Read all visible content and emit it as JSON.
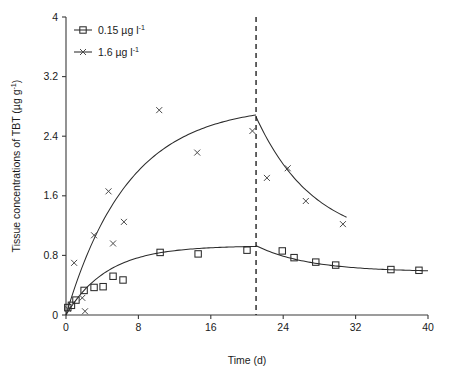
{
  "chart_data": {
    "type": "scatter",
    "title": "",
    "xlabel": "Time (d)",
    "ylabel": "Tissue concentrations of TBT (µg g⁻¹)",
    "xlim": [
      0,
      40
    ],
    "ylim": [
      0,
      4
    ],
    "xticks": [
      "0",
      "8",
      "16",
      "24",
      "32",
      "40"
    ],
    "xtick_values": [
      0,
      8,
      16,
      24,
      32,
      40
    ],
    "yticks": [
      "0",
      "0.8",
      "1.6",
      "2.4",
      "3.2",
      "4"
    ],
    "ytick_values": [
      0,
      0.8,
      1.6,
      2.4,
      3.2,
      4
    ],
    "grid": false,
    "legend_position": "top-left",
    "annotations": [
      {
        "name": "exposure-depuration-divider",
        "type": "vline",
        "x": 21,
        "style": "dashed"
      }
    ],
    "series": [
      {
        "name": "0.15 µg l⁻¹",
        "marker": "square",
        "points": [
          {
            "x": 0.2,
            "y": 0.1
          },
          {
            "x": 0.6,
            "y": 0.13
          },
          {
            "x": 1.1,
            "y": 0.2
          },
          {
            "x": 2.0,
            "y": 0.33
          },
          {
            "x": 3.1,
            "y": 0.37
          },
          {
            "x": 4.1,
            "y": 0.38
          },
          {
            "x": 5.2,
            "y": 0.52
          },
          {
            "x": 6.3,
            "y": 0.47
          },
          {
            "x": 10.4,
            "y": 0.84
          },
          {
            "x": 14.6,
            "y": 0.82
          },
          {
            "x": 20.0,
            "y": 0.87
          },
          {
            "x": 23.9,
            "y": 0.86
          },
          {
            "x": 25.2,
            "y": 0.77
          },
          {
            "x": 27.6,
            "y": 0.71
          },
          {
            "x": 29.8,
            "y": 0.67
          },
          {
            "x": 35.9,
            "y": 0.61
          },
          {
            "x": 39.0,
            "y": 0.6
          }
        ],
        "fit_curve": {
          "uptake": {
            "plateau": 0.93,
            "rate": 0.22,
            "x_end": 21
          },
          "depuration": {
            "y0": 0.93,
            "y_inf": 0.58,
            "rate": 0.17,
            "x_start": 21,
            "x_end": 40
          }
        }
      },
      {
        "name": "1.6 µg l⁻¹",
        "marker": "cross",
        "points": [
          {
            "x": 0.2,
            "y": 0.08
          },
          {
            "x": 0.9,
            "y": 0.7
          },
          {
            "x": 1.8,
            "y": 0.23
          },
          {
            "x": 2.1,
            "y": 0.05
          },
          {
            "x": 3.1,
            "y": 1.07
          },
          {
            "x": 4.7,
            "y": 1.66
          },
          {
            "x": 5.2,
            "y": 0.96
          },
          {
            "x": 6.4,
            "y": 1.25
          },
          {
            "x": 10.3,
            "y": 2.75
          },
          {
            "x": 14.5,
            "y": 2.18
          },
          {
            "x": 20.6,
            "y": 2.47
          },
          {
            "x": 22.2,
            "y": 1.84
          },
          {
            "x": 24.5,
            "y": 1.97
          },
          {
            "x": 26.5,
            "y": 1.53
          },
          {
            "x": 30.6,
            "y": 1.22
          }
        ],
        "fit_curve": {
          "uptake": {
            "plateau": 2.82,
            "rate": 0.145,
            "x_end": 21
          },
          "depuration": {
            "y0": 2.66,
            "y_inf": 0.95,
            "rate": 0.155,
            "x_start": 21,
            "x_end": 31
          }
        }
      }
    ]
  },
  "legend": {
    "items": [
      {
        "label_main": "0.15 µg l",
        "label_sup": "-1",
        "marker": "square"
      },
      {
        "label_main": "1.6 µg l",
        "label_sup": "-1",
        "marker": "cross"
      }
    ]
  },
  "axes": {
    "ylabel_main_a": "Tissue concentrations of TBT (µg g",
    "ylabel_sup": "-1",
    "ylabel_main_b": ")",
    "xlabel": "Time (d)"
  },
  "colors": {
    "axis": "#3a3a3a",
    "curve": "#2b2b2b",
    "marker": "#4a4a4a",
    "divider": "#111111",
    "background": "#ffffff"
  }
}
